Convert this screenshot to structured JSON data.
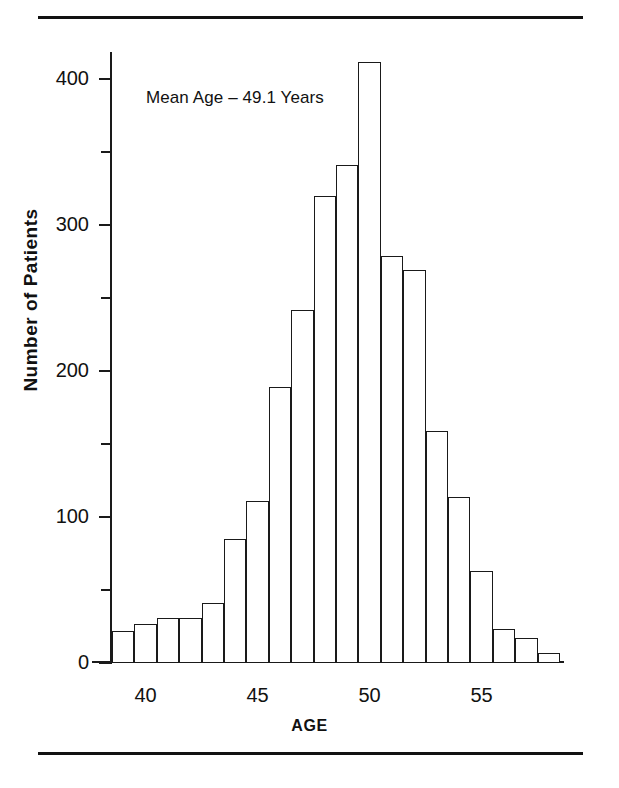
{
  "figure": {
    "annotation": "Mean Age – 49.1 Years",
    "axis_title_y": "Number of Patients",
    "axis_title_x": "AGE"
  },
  "chart_data": {
    "type": "bar",
    "title": "",
    "subtitle": "",
    "xlabel": "AGE",
    "ylabel": "Number of Patients",
    "annotations": [
      "Mean Age – 49.1 Years"
    ],
    "grid": false,
    "legend": "none",
    "xlim": [
      38.5,
      58.5
    ],
    "ylim": [
      0,
      420
    ],
    "xticks": [
      40,
      45,
      50,
      55
    ],
    "xtick_labels": [
      "40",
      "45",
      "50",
      "55"
    ],
    "yticks": [
      0,
      100,
      200,
      300,
      400
    ],
    "ytick_labels": [
      "0",
      "100",
      "200",
      "300",
      "400"
    ],
    "yticks_minor": [
      50,
      150,
      250,
      350
    ],
    "bin_width": 1,
    "categories": [
      39,
      40,
      41,
      42,
      43,
      44,
      45,
      46,
      47,
      48,
      49,
      50,
      51,
      52,
      53,
      54,
      55,
      56,
      57,
      58
    ],
    "values": [
      22,
      27,
      31,
      31,
      41,
      85,
      111,
      189,
      242,
      320,
      341,
      412,
      279,
      269,
      159,
      114,
      63,
      23,
      17,
      7
    ],
    "colors": {
      "bar_fill": "#ffffff",
      "bar_stroke": "#1a1a1a",
      "axis": "#1a1a1a",
      "text": "#111111"
    }
  }
}
